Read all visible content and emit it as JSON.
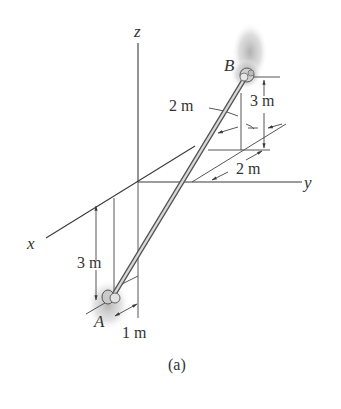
{
  "figure": {
    "caption": "(a)",
    "axes": {
      "x_label": "x",
      "y_label": "y",
      "z_label": "z"
    },
    "points": {
      "A_label": "A",
      "B_label": "B"
    },
    "dimensions": {
      "B_offset_x": "2 m",
      "B_height": "3 m",
      "B_offset_y": "2 m",
      "A_height": "3 m",
      "A_offset": "1 m"
    },
    "colors": {
      "line": "#3a3a3a",
      "rod": "#8a8a8a",
      "shadow": "#bdbdbd",
      "text": "#333333"
    }
  }
}
